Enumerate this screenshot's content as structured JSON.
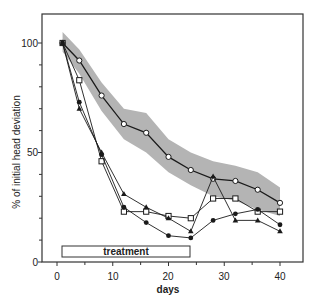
{
  "chart_data": {
    "type": "line",
    "title": "",
    "xlabel": "days",
    "ylabel": "% of initial head deviation",
    "xlim": [
      0,
      40
    ],
    "ylim": [
      0,
      100
    ],
    "xticks": [
      0,
      10,
      20,
      30,
      40
    ],
    "xminor": [
      5,
      15,
      25,
      35
    ],
    "yticks": [
      0,
      50,
      100
    ],
    "yminor": [
      10,
      20,
      30,
      40,
      60,
      70,
      80,
      90
    ],
    "grid": false,
    "legend": null,
    "x": [
      1,
      4,
      8,
      12,
      16,
      20,
      24,
      28,
      32,
      36,
      40
    ],
    "series": [
      {
        "name": "control (open circles)",
        "marker": "open-circle",
        "values": [
          100,
          92,
          76,
          63,
          59,
          48,
          42,
          38,
          37,
          33,
          27
        ]
      },
      {
        "name": "open squares",
        "marker": "open-square",
        "values": [
          100,
          83,
          46,
          23,
          23,
          21,
          20,
          29,
          29,
          23,
          23
        ]
      },
      {
        "name": "filled circles",
        "marker": "filled-circle",
        "values": [
          100,
          73,
          49,
          25,
          18,
          12,
          11,
          19,
          22,
          24,
          17
        ]
      },
      {
        "name": "filled triangles",
        "marker": "filled-triangle",
        "values": [
          100,
          70,
          50,
          31,
          25,
          20,
          14,
          39,
          19,
          19,
          14
        ]
      }
    ],
    "band": {
      "description": "shaded range around control",
      "x": [
        1,
        4,
        8,
        12,
        16,
        20,
        24,
        28,
        32,
        36,
        40
      ],
      "upper": [
        105,
        97,
        82,
        70,
        68,
        56,
        50,
        46,
        44,
        41,
        34
      ],
      "lower": [
        96,
        86,
        69,
        56,
        50,
        41,
        35,
        30,
        28,
        24,
        21
      ]
    },
    "annotations": [
      {
        "type": "box",
        "label": "treatment",
        "x_start": 1,
        "x_end": 24
      }
    ]
  },
  "labels": {
    "xlabel": "days",
    "ylabel": "% of initial head deviation",
    "treatment": "treatment",
    "xtick_0": "0",
    "xtick_10": "10",
    "xtick_20": "20",
    "xtick_30": "30",
    "xtick_40": "40",
    "ytick_0": "0",
    "ytick_50": "50",
    "ytick_100": "100"
  },
  "colors": {
    "line": "#1a1a1a",
    "band": "#b4b4b4",
    "frame": "#333333"
  }
}
